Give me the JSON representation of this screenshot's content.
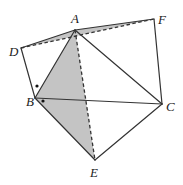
{
  "diagram": {
    "type": "geometry",
    "colors": {
      "line": "#333333",
      "shade": "#c4c4c4",
      "background": "#ffffff",
      "dot": "#111111"
    },
    "points": {
      "A": {
        "x": 75,
        "y": 30,
        "label": "A",
        "lx": 71,
        "ly": 23
      },
      "B": {
        "x": 35,
        "y": 98,
        "label": "B",
        "lx": 26,
        "ly": 106
      },
      "C": {
        "x": 162,
        "y": 104,
        "label": "C",
        "lx": 166,
        "ly": 111
      },
      "D": {
        "x": 21,
        "y": 48,
        "label": "D",
        "lx": 9,
        "ly": 56
      },
      "E": {
        "x": 95,
        "y": 160,
        "label": "E",
        "lx": 90,
        "ly": 177
      },
      "F": {
        "x": 154,
        "y": 19,
        "label": "F",
        "lx": 158,
        "ly": 24
      }
    },
    "shaded_regions": [
      {
        "name": "triangle-DAF",
        "vertices": [
          "D",
          "A",
          "F"
        ]
      },
      {
        "name": "triangle-ABE",
        "vertices": [
          "A",
          "B",
          "E"
        ]
      }
    ],
    "solid_segments": [
      [
        "D",
        "A"
      ],
      [
        "A",
        "F"
      ],
      [
        "F",
        "C"
      ],
      [
        "D",
        "B"
      ],
      [
        "A",
        "B"
      ],
      [
        "A",
        "C"
      ],
      [
        "B",
        "C"
      ],
      [
        "B",
        "E"
      ],
      [
        "E",
        "C"
      ]
    ],
    "dashed_segments": [
      [
        "D",
        "F"
      ],
      [
        "A",
        "E"
      ]
    ],
    "angle_marks": [
      {
        "name": "angle-DBA-dot",
        "x": 37,
        "y": 86
      },
      {
        "name": "angle-ABE-dot",
        "x": 43,
        "y": 101
      }
    ]
  }
}
